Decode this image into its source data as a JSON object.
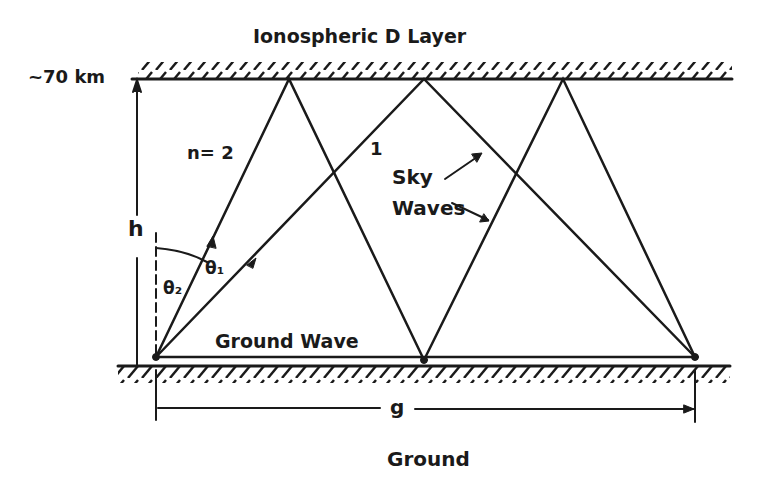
{
  "title": "Ionospheric D Layer",
  "height_label": "~70 km",
  "h_label": "h",
  "mode2_label": "n= 2",
  "mode1_label": "1",
  "sky_waves_label_1": "Sky",
  "sky_waves_label_2": "Waves",
  "theta2_label": "θ₂",
  "theta1_label": "θ₁",
  "ground_wave_label": "Ground Wave",
  "distance_label": "g",
  "ground_label": "Ground",
  "colors": {
    "ink": "#1a1a1a",
    "background": "#ffffff"
  }
}
